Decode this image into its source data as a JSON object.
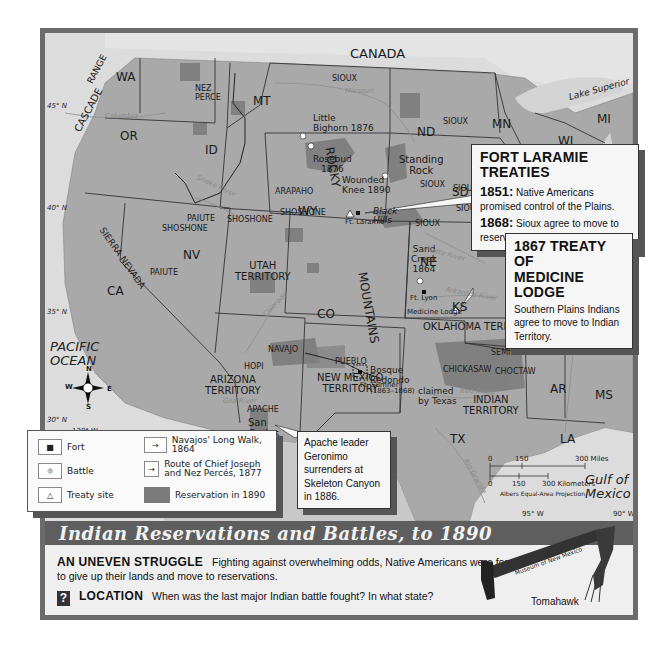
{
  "map": {
    "title": "Indian Reservations and Battles, to 1890",
    "colors": {
      "land": "#a9a9a9",
      "water": "#dcdcdc",
      "reservation": "#7a7a7a",
      "frame": "#6b6b6b",
      "title_bar": "#5e5e5e"
    },
    "countries": {
      "canada": "CANADA",
      "mexico": "MEXICO"
    },
    "water": {
      "pacific": "PACIFIC OCEAN",
      "pacific_l1": "PACIFIC",
      "pacific_l2": "OCEAN",
      "gulf_l1": "Gulf of",
      "gulf_l2": "Mexico",
      "lake_superior": "Lake Superior"
    },
    "states": [
      "WA",
      "OR",
      "CA",
      "NV",
      "ID",
      "MT",
      "WY",
      "CO",
      "ND",
      "SD",
      "NE",
      "KS",
      "MN",
      "WI",
      "MI",
      "MO",
      "AR",
      "LA",
      "MS",
      "TX"
    ],
    "territories": {
      "utah": [
        "UTAH",
        "TERRITORY"
      ],
      "arizona": [
        "ARIZONA",
        "TERRITORY"
      ],
      "new_mexico": [
        "NEW MEXICO",
        "TERRITORY"
      ],
      "indian": [
        "INDIAN",
        "TERRITORY"
      ],
      "oklahoma": "OKLAHOMA TERR."
    },
    "mountains": {
      "cascade": "CASCADE",
      "range": "RANGE",
      "sierra": "SIERRA NEVADA",
      "rocky": "ROCKY",
      "mountains": "MOUNTAINS",
      "great": "Great",
      "plains": "Plains"
    },
    "tribes": {
      "nez_perce_1": "NEZ",
      "nez_perce_2": "PERCE",
      "sioux": "SIOUX",
      "arapaho": "ARAPAHO",
      "shoshone": "SHOSHONE",
      "paiute": "PAIUTE",
      "navajo": "NAVAJO",
      "hopi": "HOPI",
      "apache": "APACHE",
      "pueblo": "PUEBLO",
      "cherokee": "CHEROKEE",
      "creek": "CREEK",
      "seminole": "SEMINOLE",
      "chickasaw": "CHICKASAW",
      "choctaw": "CHOCTAW",
      "standing_rock_1": "Standing",
      "standing_rock_2": "Rock",
      "black_hills_1": "Black",
      "black_hills_2": "Hills",
      "san_carlos_1": "San",
      "san_carlos_2": "Carlos"
    },
    "events": {
      "little_bighorn_1": "Little",
      "little_bighorn_2": "Bighorn 1876",
      "rosebud_1": "Rosebud",
      "rosebud_2": "1876",
      "wounded_knee_1": "Wounded",
      "wounded_knee_2": "Knee 1890",
      "sand_creek_1": "Sand",
      "sand_creek_2": "Creek",
      "sand_creek_3": "1864",
      "bosque_1": "Bosque",
      "bosque_2": "Redondo",
      "bosque_3": "(1863–1868)",
      "claimed_1": "claimed",
      "claimed_2": "by Texas"
    },
    "forts": {
      "laramie": "Ft. Laramie",
      "lyon": "Ft. Lyon",
      "sumner": "Ft. Sumner"
    },
    "treaty_sites": {
      "medicine_lodge": "Medicine Lodge"
    },
    "rivers": {
      "columbia": "Columbia",
      "snake": "Snake River",
      "missouri": "Missouri",
      "platte": "Platte River",
      "arkansas": "Arkansas River",
      "colorado": "Colorado",
      "gila": "Gila River",
      "red": "Red River",
      "rio_grande": "Rio Grande",
      "mississippi": "Mississippi"
    },
    "gridlines": {
      "lat45": "45° N",
      "lat40": "40° N",
      "lat35": "35° N",
      "lat30": "30° N",
      "lon120": "120° W",
      "lon95": "95° W",
      "lon90": "90° W"
    },
    "compass": {
      "n": "N",
      "s": "S",
      "e": "E",
      "w": "W"
    },
    "scale": {
      "miles_0": "0",
      "miles_150": "150",
      "miles_300": "300 Miles",
      "km_0": "0",
      "km_150": "150",
      "km_300": "300 Kilometers",
      "projection": "Albers Equal-Area Projection"
    }
  },
  "callouts": {
    "fort_laramie": {
      "title": "FORT LARAMIE TREATIES",
      "y1851": "1851:",
      "t1851": "Native Americans promised control of the Plains.",
      "y1868": "1868:",
      "t1868": "Sioux agree to move to reservation in Black Hills."
    },
    "medicine_lodge": {
      "title_1": "1867 TREATY OF",
      "title_2": "MEDICINE LODGE",
      "text": "Southern Plains Indians agree to move to Indian Territory."
    },
    "geronimo": {
      "text": "Apache leader Geronimo surrenders at Skeleton Canyon in 1886."
    }
  },
  "legend": {
    "items": [
      {
        "symbol": "■",
        "label": "Fort"
      },
      {
        "symbol": "☼",
        "label": "Battle"
      },
      {
        "symbol": "△",
        "label": "Treaty site"
      },
      {
        "symbol": "→",
        "label": "Navajos' Long Walk, 1864"
      },
      {
        "symbol": "→",
        "label": "Route of Chief Joseph and Nez Percés, 1877"
      },
      {
        "symbol": "reservation-swatch",
        "label": "Reservation in 1890"
      }
    ]
  },
  "caption": {
    "head1": "AN UNEVEN STRUGGLE",
    "text1": "Fighting against overwhelming odds, Native Americans were forced",
    "text1b": "to give up their lands and move to reservations.",
    "head2": "LOCATION",
    "q_icon": "?",
    "text2": "When was the last major Indian battle fought? In what state?"
  },
  "artifact": {
    "label": "Tomahawk",
    "credit": "Museum of New Mexico"
  }
}
